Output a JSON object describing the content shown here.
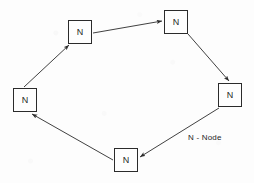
{
  "diagram": {
    "type": "ring-network",
    "canvas": {
      "width": 254,
      "height": 183
    },
    "background_color": "#fdfdfd",
    "stroke_color": "#2b2b2b",
    "node_fill_color": "#fefefe",
    "nodes": [
      {
        "id": "node-top-left",
        "label": "N",
        "x": 68,
        "y": 20,
        "w": 24,
        "h": 24
      },
      {
        "id": "node-top-right",
        "label": "N",
        "x": 164,
        "y": 10,
        "w": 24,
        "h": 24
      },
      {
        "id": "node-right",
        "label": "N",
        "x": 218,
        "y": 83,
        "w": 24,
        "h": 24
      },
      {
        "id": "node-bottom",
        "label": "N",
        "x": 114,
        "y": 148,
        "w": 24,
        "h": 24
      },
      {
        "id": "node-left",
        "label": "N",
        "x": 13,
        "y": 88,
        "w": 24,
        "h": 24
      }
    ],
    "edges": [
      {
        "id": "edge-topleft-to-topright",
        "from": "node-top-left",
        "to": "node-top-right",
        "x1": 93,
        "y1": 33,
        "x2": 162,
        "y2": 21,
        "arrow": "end"
      },
      {
        "id": "edge-topright-to-right",
        "from": "node-top-right",
        "to": "node-right",
        "x1": 188,
        "y1": 34,
        "x2": 229,
        "y2": 81,
        "arrow": "end"
      },
      {
        "id": "edge-right-to-bottom",
        "from": "node-right",
        "to": "node-bottom",
        "x1": 219,
        "y1": 108,
        "x2": 140,
        "y2": 157,
        "arrow": "end"
      },
      {
        "id": "edge-bottom-to-left",
        "from": "node-bottom",
        "to": "node-left",
        "x1": 113,
        "y1": 160,
        "x2": 32,
        "y2": 114,
        "arrow": "end"
      },
      {
        "id": "edge-left-to-topleft",
        "from": "node-left",
        "to": "node-top-left",
        "x1": 24,
        "y1": 87,
        "x2": 69,
        "y2": 45,
        "arrow": "end"
      }
    ]
  },
  "legend": {
    "text": "N - Node",
    "x": 188,
    "y": 133
  }
}
